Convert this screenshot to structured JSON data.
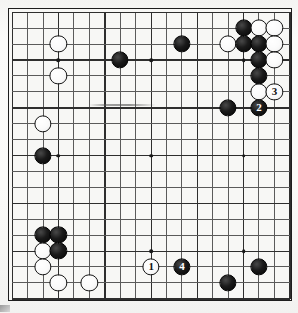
{
  "board": {
    "title": "Go board diagram",
    "size": 19,
    "grid_origin_x": 11,
    "grid_origin_y": 11,
    "grid_spacing": 15.33,
    "colors": {
      "board_background": "#f7f7f5",
      "grid_line": "#5a5a5a",
      "border": "#1d1d1d",
      "black_stone": "#0a0a0a",
      "white_stone": "#fafafa",
      "star_point": "#181818"
    },
    "star_points": [
      {
        "col": 3,
        "row": 3
      },
      {
        "col": 9,
        "row": 3
      },
      {
        "col": 15,
        "row": 3
      },
      {
        "col": 3,
        "row": 9
      },
      {
        "col": 9,
        "row": 9
      },
      {
        "col": 15,
        "row": 9
      },
      {
        "col": 3,
        "row": 15
      },
      {
        "col": 9,
        "row": 15
      },
      {
        "col": 15,
        "row": 15
      }
    ],
    "stones": [
      {
        "col": 15,
        "row": 1,
        "color": "black",
        "label": ""
      },
      {
        "col": 16,
        "row": 1,
        "color": "white",
        "label": ""
      },
      {
        "col": 17,
        "row": 1,
        "color": "white",
        "label": ""
      },
      {
        "col": 14,
        "row": 2,
        "color": "white",
        "label": ""
      },
      {
        "col": 15,
        "row": 2,
        "color": "black",
        "label": ""
      },
      {
        "col": 16,
        "row": 2,
        "color": "black",
        "label": ""
      },
      {
        "col": 17,
        "row": 2,
        "color": "white",
        "label": ""
      },
      {
        "col": 16,
        "row": 3,
        "color": "black",
        "label": ""
      },
      {
        "col": 17,
        "row": 3,
        "color": "white",
        "label": ""
      },
      {
        "col": 16,
        "row": 4,
        "color": "black",
        "label": ""
      },
      {
        "col": 11,
        "row": 2,
        "color": "black",
        "label": ""
      },
      {
        "col": 7,
        "row": 3,
        "color": "black",
        "label": ""
      },
      {
        "col": 3,
        "row": 2,
        "color": "white",
        "label": ""
      },
      {
        "col": 3,
        "row": 4,
        "color": "white",
        "label": ""
      },
      {
        "col": 2,
        "row": 7,
        "color": "white",
        "label": ""
      },
      {
        "col": 2,
        "row": 9,
        "color": "black",
        "label": ""
      },
      {
        "col": 16,
        "row": 5,
        "color": "white",
        "label": ""
      },
      {
        "col": 17,
        "row": 5,
        "color": "white",
        "label": "3"
      },
      {
        "col": 16,
        "row": 6,
        "color": "black",
        "label": "2"
      },
      {
        "col": 14,
        "row": 6,
        "color": "black",
        "label": ""
      },
      {
        "col": 2,
        "row": 14,
        "color": "black",
        "label": ""
      },
      {
        "col": 3,
        "row": 14,
        "color": "black",
        "label": ""
      },
      {
        "col": 2,
        "row": 15,
        "color": "white",
        "label": ""
      },
      {
        "col": 3,
        "row": 15,
        "color": "black",
        "label": ""
      },
      {
        "col": 2,
        "row": 16,
        "color": "white",
        "label": ""
      },
      {
        "col": 3,
        "row": 17,
        "color": "white",
        "label": ""
      },
      {
        "col": 5,
        "row": 17,
        "color": "white",
        "label": ""
      },
      {
        "col": 9,
        "row": 16,
        "color": "white",
        "label": "1"
      },
      {
        "col": 11,
        "row": 16,
        "color": "black",
        "label": "4"
      },
      {
        "col": 16,
        "row": 16,
        "color": "black",
        "label": ""
      },
      {
        "col": 14,
        "row": 17,
        "color": "black",
        "label": ""
      }
    ],
    "move_labels": [
      {
        "number": "1",
        "color": "white"
      },
      {
        "number": "2",
        "color": "black"
      },
      {
        "number": "3",
        "color": "white"
      },
      {
        "number": "4",
        "color": "black"
      }
    ],
    "artifacts": {
      "smudge_label": "scan-smudge",
      "corner_label": "scan-corner-mark"
    }
  }
}
